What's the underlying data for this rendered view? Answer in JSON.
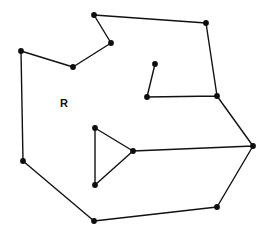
{
  "figure": {
    "type": "polygon-diagram",
    "background_color": "#ffffff",
    "stroke_color": "#111111",
    "vertex_color": "#0d0d0d",
    "stroke_width": 1.4,
    "vertex_radius": 2.9,
    "canvas": {
      "width": 270,
      "height": 235
    }
  },
  "labels": [
    {
      "name": "region-label-r",
      "text": "R",
      "x": 64,
      "y": 104,
      "font_size": 11,
      "font_weight": "bold"
    }
  ],
  "polygon": {
    "name": "region-r-boundary",
    "closed": true,
    "vertex_count": 16,
    "points_attr": "94,15 206,23 217,96 147,97 155,64 147,97 217,96 253,146 133,151 95,128 95,185 133,151 253,146 217,207 94,221 23,161 21,51 73,67 111,43 94,15",
    "vertices": [
      {
        "id": "v1",
        "name": "vertex-top",
        "x": 94,
        "y": 15
      },
      {
        "id": "v2",
        "name": "vertex-top-right",
        "x": 206,
        "y": 23
      },
      {
        "id": "v3",
        "name": "vertex-right-upper",
        "x": 217,
        "y": 96
      },
      {
        "id": "v4",
        "name": "vertex-spike-base",
        "x": 147,
        "y": 97
      },
      {
        "id": "v5",
        "name": "vertex-spike-tip",
        "x": 155,
        "y": 64
      },
      {
        "id": "v6",
        "name": "vertex-right-far",
        "x": 253,
        "y": 146
      },
      {
        "id": "v7",
        "name": "vertex-triangle-apex",
        "x": 133,
        "y": 151
      },
      {
        "id": "v8",
        "name": "vertex-triangle-top",
        "x": 95,
        "y": 128
      },
      {
        "id": "v9",
        "name": "vertex-triangle-bottom",
        "x": 95,
        "y": 185
      },
      {
        "id": "v10",
        "name": "vertex-bottom-right",
        "x": 217,
        "y": 207
      },
      {
        "id": "v11",
        "name": "vertex-bottom",
        "x": 94,
        "y": 221
      },
      {
        "id": "v12",
        "name": "vertex-left-lower",
        "x": 23,
        "y": 161
      },
      {
        "id": "v13",
        "name": "vertex-left-upper",
        "x": 21,
        "y": 51
      },
      {
        "id": "v14",
        "name": "vertex-notch-bottom",
        "x": 73,
        "y": 67
      },
      {
        "id": "v15",
        "name": "vertex-notch-right",
        "x": 111,
        "y": 43
      }
    ]
  }
}
